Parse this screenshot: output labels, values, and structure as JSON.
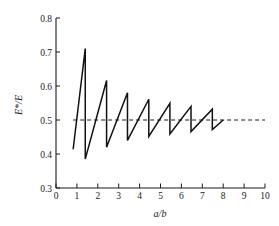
{
  "chart_data": {
    "type": "line",
    "title": "",
    "subtitle": "",
    "xlabel": "a/b",
    "ylabel": "E*/E",
    "xlim": [
      0,
      10
    ],
    "ylim": [
      0.3,
      0.8
    ],
    "xticks": [
      "0",
      "1",
      "2",
      "3",
      "4",
      "5",
      "6",
      "7",
      "8",
      "9",
      "10"
    ],
    "xtick_values": [
      0,
      1,
      2,
      3,
      4,
      5,
      6,
      7,
      8,
      9,
      10
    ],
    "yticks": [
      "0.3",
      "0.4",
      "0.5",
      "0.6",
      "0.7",
      "0.8"
    ],
    "ytick_values": [
      0.3,
      0.4,
      0.5,
      0.6,
      0.7,
      0.8
    ],
    "grid": false,
    "legend": false,
    "legend_position": "none",
    "series": [
      {
        "name": "E*/E sawtooth",
        "style": "solid",
        "color": "#111111",
        "x": [
          0.82,
          1.4,
          1.4,
          2.42,
          2.42,
          3.42,
          3.42,
          4.44,
          4.44,
          5.45,
          5.45,
          6.46,
          6.46,
          7.48,
          7.48,
          8.0
        ],
        "y": [
          0.414,
          0.71,
          0.385,
          0.616,
          0.42,
          0.58,
          0.44,
          0.561,
          0.452,
          0.549,
          0.459,
          0.54,
          0.466,
          0.532,
          0.472,
          0.5
        ]
      }
    ],
    "annotations": [
      {
        "type": "hline",
        "name": "asymptote",
        "y": 0.5,
        "x_start": 0.82,
        "x_end": 10.0,
        "style": "dashed",
        "color": "#1a1a1a",
        "label": "0.5"
      }
    ]
  },
  "axes": {
    "y_title": "E*/E",
    "x_title": "a/b"
  }
}
